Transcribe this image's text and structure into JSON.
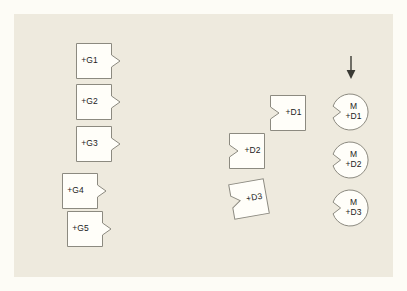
{
  "canvas": {
    "width": 407,
    "height": 291,
    "page_background": "#fdfcf6",
    "panel_background": "#eeeade",
    "shape_fill": "#fffef9",
    "shape_stroke": "#8c8a80",
    "text_color": "#1c1c1c"
  },
  "diagram": {
    "title": "",
    "arrow": {
      "name": "down-arrow",
      "direction": "down"
    },
    "groups": {
      "g_column": {
        "shape": "square-with-right-notch",
        "items": [
          {
            "id": "G1",
            "label": "+G1",
            "x": 76,
            "y": 43,
            "w": 36,
            "h": 36,
            "rotate": 0
          },
          {
            "id": "G2",
            "label": "+G2",
            "x": 76,
            "y": 84,
            "w": 36,
            "h": 36,
            "rotate": 0
          },
          {
            "id": "G3",
            "label": "+G3",
            "x": 76,
            "y": 126,
            "w": 36,
            "h": 36,
            "rotate": 0
          },
          {
            "id": "G4",
            "label": "+G4",
            "x": 62,
            "y": 173,
            "w": 36,
            "h": 36,
            "rotate": 0
          },
          {
            "id": "G5",
            "label": "+G5",
            "x": 67,
            "y": 211,
            "w": 36,
            "h": 36,
            "rotate": 0
          }
        ]
      },
      "d_column": {
        "shape": "square-with-left-tab",
        "items": [
          {
            "id": "D1",
            "label": "+D1",
            "x": 270,
            "y": 95,
            "w": 36,
            "h": 36,
            "rotate": 0
          },
          {
            "id": "D2",
            "label": "+D2",
            "x": 229,
            "y": 133,
            "w": 36,
            "h": 36,
            "rotate": 0
          },
          {
            "id": "D3",
            "label": "+D3",
            "x": 231,
            "y": 181,
            "w": 36,
            "h": 36,
            "rotate": -10
          }
        ]
      },
      "m_column": {
        "shape": "circle-with-left-notch",
        "items": [
          {
            "id": "MD1",
            "label_top": "M",
            "label_bottom": "+D1",
            "x": 332,
            "y": 94,
            "d": 36
          },
          {
            "id": "MD2",
            "label_top": "M",
            "label_bottom": "+D2",
            "x": 332,
            "y": 142,
            "d": 36
          },
          {
            "id": "MD3",
            "label_top": "M",
            "label_bottom": "+D3",
            "x": 332,
            "y": 190,
            "d": 36
          }
        ]
      }
    }
  }
}
